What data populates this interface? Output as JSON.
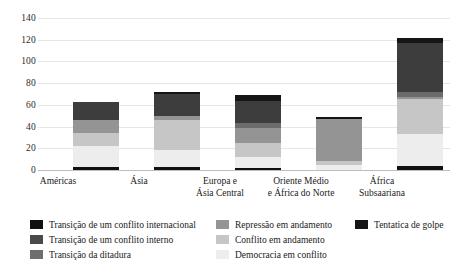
{
  "chart_data": {
    "type": "bar",
    "subtype": "stacked-bar",
    "title": "",
    "xlabel": "",
    "ylabel": "",
    "ylim": [
      0,
      140
    ],
    "yticks": [
      0,
      20,
      40,
      60,
      80,
      100,
      120,
      140
    ],
    "grid": true,
    "legend_position": "bottom",
    "categories": [
      "Américas",
      "Ásia",
      "Europa e\nÁsia Central",
      "Oriente Médio\ne África do Norte",
      "África\nSubsaariana"
    ],
    "category_labels": [
      {
        "line1": "Américas",
        "line2": ""
      },
      {
        "line1": "Ásia",
        "line2": ""
      },
      {
        "line1": "Europa e",
        "line2": "Ásia Central"
      },
      {
        "line1": "Oriente Médio",
        "line2": "e África do Norte"
      },
      {
        "line1": "África",
        "line2": "Subsaariana"
      }
    ],
    "series": [
      {
        "name": "Transição de um conflito internacional",
        "color": "#111111",
        "values": [
          3,
          3,
          2,
          0,
          4
        ]
      },
      {
        "name": "Democracia em conflito",
        "color": "#ededed",
        "values": [
          19,
          15,
          10,
          5,
          29
        ]
      },
      {
        "name": "Conflito em andamento",
        "color": "#c6c6c6",
        "values": [
          12,
          28,
          13,
          3,
          32
        ]
      },
      {
        "name": "Repressão em andamento",
        "color": "#949494",
        "values": [
          12,
          4,
          14,
          39,
          2
        ]
      },
      {
        "name": "Transição de um conflito interno",
        "color": "#6b6b6b",
        "values": [
          0,
          0,
          4,
          0,
          5
        ]
      },
      {
        "name": "Transição da ditadura",
        "color": "#3d3d3d",
        "values": [
          17,
          20,
          21,
          0,
          45
        ]
      },
      {
        "name": "Tentatica de golpe",
        "color": "#151515",
        "values": [
          0,
          2,
          5,
          2,
          5
        ]
      }
    ],
    "totals": [
      63,
      72,
      69,
      49,
      122
    ]
  },
  "legend": {
    "columns": [
      {
        "items": [
          {
            "label": "Transição de um conflito internacional",
            "color": "#111111"
          },
          {
            "label": "Transição de um conflito interno",
            "color": "#4a4a4a"
          },
          {
            "label": "Transição da ditadura",
            "color": "#6e6e6e"
          }
        ]
      },
      {
        "items": [
          {
            "label": "Repressão em andamento",
            "color": "#949494"
          },
          {
            "label": "Conflito em andamento",
            "color": "#c6c6c6"
          },
          {
            "label": "Democracia em conflito",
            "color": "#ededed"
          }
        ]
      },
      {
        "items": [
          {
            "label": "Tentatica de golpe",
            "color": "#151515"
          }
        ]
      }
    ]
  }
}
